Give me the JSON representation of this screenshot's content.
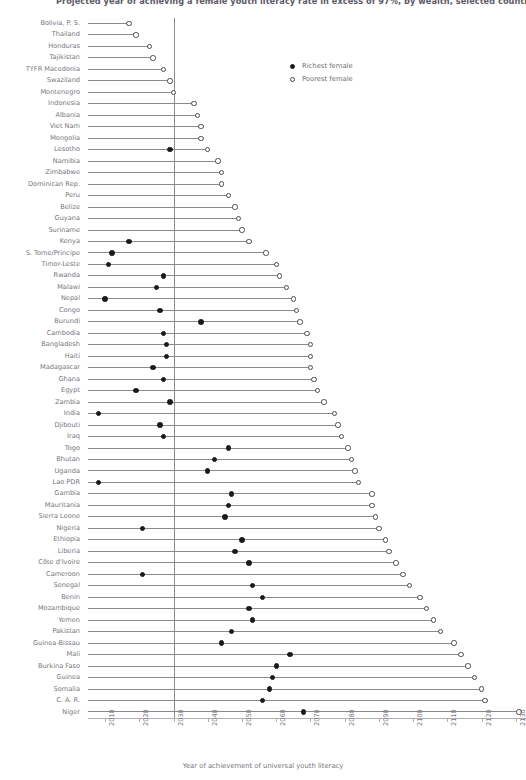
{
  "chart_data": {
    "type": "dumbbell",
    "title": "Projected year of achieving a female youth literacy rate in excess of 97%, by wealth, selected countries",
    "xlabel": "Year of achievement of universal youth literacy",
    "ylabel": "",
    "xlim": [
      2005,
      2133
    ],
    "xticks": [
      2010,
      2020,
      2030,
      2040,
      2050,
      2060,
      2070,
      2080,
      2090,
      2100,
      2110,
      2120,
      2130
    ],
    "xticklabels": [
      "2010",
      "2020",
      "2030",
      "2040",
      "2050",
      "2060",
      "2070",
      "2080",
      "2090",
      "2100",
      "2110",
      "2120",
      "2130"
    ],
    "grid": false,
    "reference_line": 2030,
    "legend_position": "top-right",
    "series": [
      {
        "name": "Richest female",
        "key": "richest",
        "marker": "filled-circle",
        "color": "#1a1a1a"
      },
      {
        "name": "Poorest female",
        "key": "poorest",
        "marker": "open-circle",
        "color": "#ffffff"
      }
    ],
    "categories": [
      "Bolivia, P. S.",
      "Thailand",
      "Honduras",
      "Tajikistan",
      "TYFR Macedonia",
      "Swaziland",
      "Montenegro",
      "Indonesia",
      "Albania",
      "Viet Nam",
      "Mongolia",
      "Lesotho",
      "Namibia",
      "Zimbabwe",
      "Dominican Rep.",
      "Peru",
      "Belize",
      "Guyana",
      "Suriname",
      "Kenya",
      "S. Tome/Principe",
      "Timor-Leste",
      "Rwanda",
      "Malawi",
      "Nepal",
      "Congo",
      "Burundi",
      "Cambodia",
      "Bangladesh",
      "Haiti",
      "Madagascar",
      "Ghana",
      "Egypt",
      "Zambia",
      "India",
      "Djibouti",
      "Iraq",
      "Togo",
      "Bhutan",
      "Uganda",
      "Lao PDR",
      "Gambia",
      "Mauritania",
      "Sierra Leone",
      "Nigeria",
      "Ethiopia",
      "Liberia",
      "Côte d'Ivoire",
      "Cameroon",
      "Senegal",
      "Benin",
      "Mozambique",
      "Yemen",
      "Pakistan",
      "Guinea-Bissau",
      "Mali",
      "Burkina Faso",
      "Guinea",
      "Somalia",
      "C. A. R.",
      "Niger"
    ],
    "richest": [
      2005,
      2005,
      2005,
      2005,
      2005,
      2005,
      2005,
      2005,
      2005,
      2005,
      2005,
      2029,
      2005,
      2005,
      2005,
      2005,
      2005,
      2005,
      2005,
      2017,
      2012,
      2011,
      2027,
      2025,
      2010,
      2026,
      2038,
      2027,
      2028,
      2028,
      2024,
      2027,
      2019,
      2029,
      2008,
      2026,
      2027,
      2046,
      2042,
      2040,
      2008,
      2047,
      2046,
      2045,
      2021,
      2050,
      2048,
      2052,
      2021,
      2053,
      2056,
      2052,
      2053,
      2047,
      2044,
      2064,
      2060,
      2059,
      2058,
      2056,
      2068
    ],
    "poorest": [
      2017,
      2019,
      2023,
      2024,
      2027,
      2029,
      2030,
      2036,
      2037,
      2038,
      2038,
      2040,
      2043,
      2044,
      2044,
      2046,
      2048,
      2049,
      2050,
      2052,
      2057,
      2060,
      2061,
      2063,
      2065,
      2066,
      2067,
      2069,
      2070,
      2070,
      2070,
      2071,
      2072,
      2074,
      2077,
      2078,
      2079,
      2081,
      2082,
      2083,
      2084,
      2088,
      2088,
      2089,
      2090,
      2092,
      2093,
      2095,
      2097,
      2099,
      2102,
      2104,
      2106,
      2108,
      2112,
      2114,
      2116,
      2118,
      2120,
      2121,
      2131
    ],
    "note": "Rows whose richest value falls at or below the left axis limit are drawn clipped to the plot edge."
  },
  "legend": {
    "items": [
      {
        "label": "Richest female"
      },
      {
        "label": "Poorest female"
      }
    ]
  }
}
